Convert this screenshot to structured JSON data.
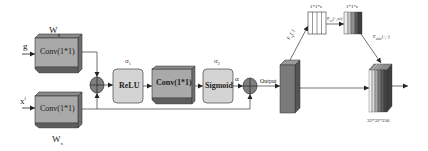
{
  "diagram": {
    "inputs": {
      "gate_signal": "g",
      "skip_signal": "x",
      "skip_superscript": "l"
    },
    "weights": {
      "gate_weight": "W",
      "gate_weight_sub": "g",
      "skip_weight": "W",
      "skip_weight_sub": "x"
    },
    "blocks": {
      "conv_gate": "Conv(1*1)",
      "conv_skip": "Conv(1*1)",
      "relu": "ReLU",
      "conv_mid": "Conv(1*1)",
      "sigmoid": "Sigmoid"
    },
    "activations": {
      "sigma1": "σ",
      "sigma1_sub": "1",
      "sigma2": "σ",
      "sigma2_sub": "2",
      "alpha": "α"
    },
    "output_label": "Output",
    "se_branch": {
      "squeeze_label": "F",
      "squeeze_sub": "sq",
      "squeeze_arg": "(·)",
      "excite_label": "F",
      "excite_sub": "ex",
      "excite_arg": "(·,w)",
      "scale_label": "F",
      "scale_sub": "scale",
      "scale_arg": "(·,·)",
      "squeeze_dim": "1*1*c",
      "excite_dim": "1*1*c"
    },
    "final_dim": "32*32*256",
    "colors": {
      "box_fill": "#a9a9a9",
      "box_side": "#6f6f6f",
      "rounded_fill": "#d4d4d4",
      "line": "#333333",
      "circle_fill": "#7f7f7f",
      "output_block_front": "#7a7a7a",
      "output_block_top": "#9a9a9a",
      "output_block_side": "#555555"
    }
  }
}
